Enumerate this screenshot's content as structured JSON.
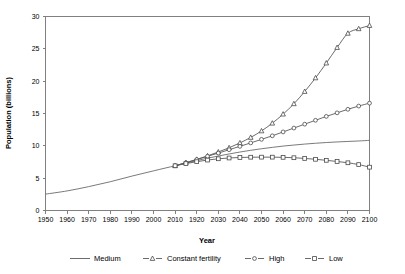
{
  "chart_data": {
    "type": "line",
    "title": "",
    "xlabel": "Year",
    "ylabel": "Population (billions)",
    "xlim": [
      1950,
      2100
    ],
    "ylim": [
      0,
      30
    ],
    "grid": false,
    "legend_position": "bottom",
    "x_tick_labels": [
      "1950",
      "1960",
      "1970",
      "1980",
      "1990",
      "2000",
      "2010",
      "1920",
      "2030",
      "2040",
      "2050",
      "2060",
      "2070",
      "2080",
      "2090",
      "2100"
    ],
    "x_tick_values": [
      1950,
      1960,
      1970,
      1980,
      1990,
      2000,
      2010,
      2020,
      2030,
      2040,
      2050,
      2060,
      2070,
      2080,
      2090,
      2100
    ],
    "y_tick_labels": [
      "0",
      "5",
      "10",
      "15",
      "20",
      "25",
      "30"
    ],
    "y_tick_values": [
      0,
      5,
      10,
      15,
      20,
      25,
      30
    ],
    "series": [
      {
        "name": "Medium",
        "marker": "none",
        "color": "#6b6b6b",
        "x": [
          1950,
          1960,
          1970,
          1980,
          1990,
          2000,
          2010,
          2015,
          2020,
          2025,
          2030,
          2035,
          2040,
          2045,
          2050,
          2055,
          2060,
          2065,
          2070,
          2075,
          2080,
          2085,
          2090,
          2095,
          2100
        ],
        "values": [
          2.53,
          3.03,
          3.69,
          4.45,
          5.32,
          6.13,
          6.92,
          7.32,
          7.72,
          8.09,
          8.42,
          8.74,
          9.04,
          9.31,
          9.55,
          9.76,
          9.96,
          10.12,
          10.27,
          10.4,
          10.51,
          10.6,
          10.68,
          10.75,
          10.85
        ]
      },
      {
        "name": "Constant fertility",
        "marker": "triangle",
        "color": "#4a4a4a",
        "x": [
          2010,
          2015,
          2020,
          2025,
          2030,
          2035,
          2040,
          2045,
          2050,
          2055,
          2060,
          2065,
          2070,
          2075,
          2080,
          2085,
          2090,
          2095,
          2100
        ],
        "values": [
          6.92,
          7.4,
          7.9,
          8.45,
          9.05,
          9.7,
          10.45,
          11.3,
          12.3,
          13.5,
          14.9,
          16.5,
          18.4,
          20.5,
          22.8,
          25.2,
          27.4,
          28.1,
          28.6
        ]
      },
      {
        "name": "High",
        "marker": "circle",
        "color": "#5a5a5a",
        "x": [
          2010,
          2015,
          2020,
          2025,
          2030,
          2035,
          2040,
          2045,
          2050,
          2055,
          2060,
          2065,
          2070,
          2075,
          2080,
          2085,
          2090,
          2095,
          2100
        ],
        "values": [
          6.92,
          7.38,
          7.88,
          8.38,
          8.88,
          9.4,
          9.92,
          10.45,
          11.0,
          11.55,
          12.15,
          12.75,
          13.35,
          13.95,
          14.55,
          15.1,
          15.65,
          16.15,
          16.6
        ]
      },
      {
        "name": "Low",
        "marker": "square",
        "color": "#7a7a7a",
        "x": [
          2010,
          2015,
          2020,
          2025,
          2030,
          2035,
          2040,
          2045,
          2050,
          2055,
          2060,
          2065,
          2070,
          2075,
          2080,
          2085,
          2090,
          2095,
          2100
        ],
        "values": [
          6.92,
          7.25,
          7.55,
          7.8,
          8.0,
          8.12,
          8.2,
          8.24,
          8.25,
          8.25,
          8.22,
          8.16,
          8.05,
          7.92,
          7.76,
          7.58,
          7.38,
          7.1,
          6.7
        ]
      }
    ]
  },
  "legend": {
    "items": [
      {
        "label": "Medium",
        "marker": "none"
      },
      {
        "label": "Constant fertility",
        "marker": "triangle"
      },
      {
        "label": "High",
        "marker": "circle"
      },
      {
        "label": "Low",
        "marker": "square"
      }
    ]
  }
}
